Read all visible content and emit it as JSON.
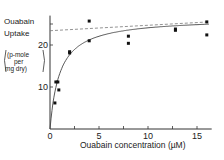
{
  "chart_data": {
    "type": "scatter",
    "title": "",
    "xlabel": "Ouabain concentration (µM)",
    "ylabel": [
      "Ouabain",
      "Uptake",
      "(p-mole",
      "per",
      "mg dry)"
    ],
    "xlim": [
      0,
      16.5
    ],
    "ylim": [
      0,
      27
    ],
    "x_ticks": [
      "0",
      "5",
      "10",
      "15"
    ],
    "y_ticks": [
      "10",
      "20"
    ],
    "grid": false,
    "series": [
      {
        "name": "observed",
        "points": [
          [
            0.5,
            6.2
          ],
          [
            0.6,
            11.2
          ],
          [
            0.8,
            11.2
          ],
          [
            0.9,
            9.3
          ],
          [
            2.0,
            18.1
          ],
          [
            2.0,
            18.4
          ],
          [
            4.0,
            21.0
          ],
          [
            4.0,
            25.7
          ],
          [
            8.0,
            22.1
          ],
          [
            8.0,
            20.4
          ],
          [
            12.8,
            23.8
          ],
          [
            12.8,
            23.5
          ],
          [
            16.0,
            25.5
          ],
          [
            16.0,
            22.4
          ]
        ]
      },
      {
        "name": "fitted curve",
        "style": "solid",
        "model": "saturating",
        "vmax": 26.5,
        "km": 1.0
      },
      {
        "name": "asymptote",
        "style": "dashed",
        "points": [
          [
            0,
            23.4
          ],
          [
            16.2,
            25.5
          ]
        ]
      }
    ]
  }
}
